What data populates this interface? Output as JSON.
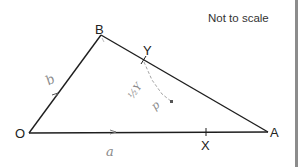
{
  "diagram": {
    "note": "Not to scale",
    "vertices": {
      "O": {
        "label": "O",
        "x": 29,
        "y": 133
      },
      "B": {
        "label": "B",
        "x": 101,
        "y": 35
      },
      "A": {
        "label": "A",
        "x": 268,
        "y": 132
      }
    },
    "points": {
      "Y": {
        "label": "Y",
        "on": "BA",
        "x": 144,
        "y": 61
      },
      "X": {
        "label": "X",
        "on": "OA",
        "x": 206,
        "y": 132
      }
    },
    "edges": [
      "OB",
      "BA",
      "OA"
    ],
    "handwriting": {
      "vector_OB": "b",
      "vector_OA": "a",
      "annotation_near_Y": "½Y",
      "annotation_p": "p"
    },
    "colors": {
      "line": "#1e1e1e",
      "text": "#222222",
      "pencil": "#8a8a8a",
      "border": "#8c8c8c"
    }
  }
}
